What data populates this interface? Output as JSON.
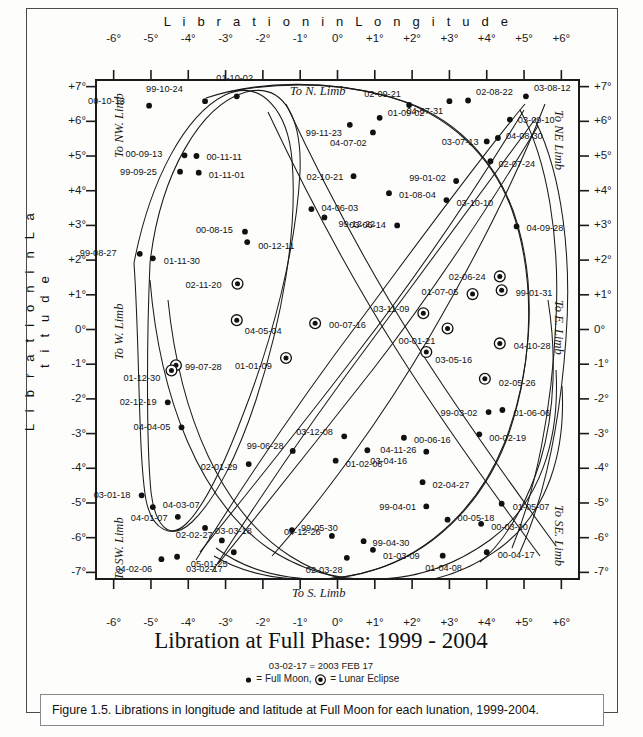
{
  "figure": {
    "title": "Libration at Full Phase:  1999 - 2004",
    "note_date_key": "03-02-17 = 2003 FEB 17",
    "legend_full_moon": "= Full Moon,",
    "legend_eclipse": "= Lunar Eclipse",
    "caption": "Figure 1.5. Librations in longitude and latitude at Full Moon for each lunation, 1999-2004."
  },
  "limbs": {
    "north": "To N. Limb",
    "south": "To S. Limb",
    "east": "To E. Limb",
    "west": "To W. Limb",
    "northwest": "To NW. Limb",
    "northeast": "To NE Limb",
    "southwest": "To SW. Limb",
    "southeast": "To SE. Limb"
  },
  "chart_data": {
    "type": "scatter",
    "title": "Libration at Full Phase:  1999 - 2004",
    "xlabel": "L i b r a t i o n   i n   L o n g i t u d e",
    "ylabel": "L i b r a t i o n   i n   L a t i t u d e",
    "xlim": [
      -6.6,
      6.6
    ],
    "ylim": [
      -7.4,
      7.4
    ],
    "grid": false,
    "xticks": [
      "-6°",
      "-5°",
      "-4°",
      "-3°",
      "-2°",
      "-1°",
      "0°",
      "+1°",
      "+2°",
      "+3°",
      "+4°",
      "+5°",
      "+6°"
    ],
    "xtickvals": [
      -6,
      -5,
      -4,
      -3,
      -2,
      -1,
      0,
      1,
      2,
      3,
      4,
      5,
      6
    ],
    "yticks": [
      "+7°",
      "+6°",
      "+5°",
      "+4°",
      "+3°",
      "+2°",
      "+1°",
      "0°",
      "-1°",
      "-2°",
      "-3°",
      "-4°",
      "-5°",
      "-6°",
      "-7°"
    ],
    "ytickvals": [
      7,
      6,
      5,
      4,
      3,
      2,
      1,
      0,
      -1,
      -2,
      -3,
      -4,
      -5,
      -6,
      -7
    ],
    "legend": [
      "= Full Moon",
      "= Lunar Eclipse"
    ],
    "points": [
      {
        "label": "00-10-13",
        "x": -5.05,
        "y": 6.45,
        "eclipse": false,
        "lx": -24,
        "ly": -4,
        "anchor": "end"
      },
      {
        "label": "99-10-24",
        "x": -3.55,
        "y": 6.58,
        "eclipse": false,
        "lx": -22,
        "ly": -11,
        "anchor": "end"
      },
      {
        "label": "01-10-02",
        "x": -2.7,
        "y": 6.72,
        "eclipse": false,
        "lx": -2,
        "ly": -17,
        "anchor": "middle"
      },
      {
        "label": "01-09-02",
        "x": 1.13,
        "y": 6.1,
        "eclipse": false,
        "lx": 8,
        "ly": -4,
        "anchor": "start"
      },
      {
        "label": "99-11-23",
        "x": 0.33,
        "y": 5.9,
        "eclipse": false,
        "lx": -8,
        "ly": 9,
        "anchor": "end"
      },
      {
        "label": "02-09-21",
        "x": 1.92,
        "y": 6.47,
        "eclipse": false,
        "lx": -8,
        "ly": -10,
        "anchor": "end"
      },
      {
        "label": "04-07-31",
        "x": 3.0,
        "y": 6.58,
        "eclipse": false,
        "lx": -6,
        "ly": 11,
        "anchor": "end"
      },
      {
        "label": "02-08-22",
        "x": 3.5,
        "y": 6.6,
        "eclipse": false,
        "lx": 8,
        "ly": -8,
        "anchor": "start"
      },
      {
        "label": "03-08-12",
        "x": 5.05,
        "y": 6.72,
        "eclipse": false,
        "lx": 8,
        "ly": -7,
        "anchor": "start"
      },
      {
        "label": "03-09-10",
        "x": 4.62,
        "y": 6.05,
        "eclipse": false,
        "lx": 8,
        "ly": 1,
        "anchor": "start"
      },
      {
        "label": "04-08-30",
        "x": 4.3,
        "y": 5.52,
        "eclipse": false,
        "lx": 8,
        "ly": -1,
        "anchor": "start"
      },
      {
        "label": "03-07-13",
        "x": 4.0,
        "y": 5.42,
        "eclipse": false,
        "lx": -8,
        "ly": 2,
        "anchor": "end"
      },
      {
        "label": "02-07-24",
        "x": 4.1,
        "y": 4.85,
        "eclipse": false,
        "lx": 8,
        "ly": 4,
        "anchor": "start"
      },
      {
        "label": "04-07-02",
        "x": 0.95,
        "y": 5.68,
        "eclipse": false,
        "lx": -6,
        "ly": 12,
        "anchor": "end"
      },
      {
        "label": "00-09-13",
        "x": -4.1,
        "y": 5.02,
        "eclipse": false,
        "lx": -22,
        "ly": 0,
        "anchor": "end"
      },
      {
        "label": "00-11-11",
        "x": -3.78,
        "y": 5.0,
        "eclipse": false,
        "lx": 10,
        "ly": 2,
        "anchor": "start"
      },
      {
        "label": "99-09-25",
        "x": -4.22,
        "y": 4.55,
        "eclipse": false,
        "lx": -23,
        "ly": 1,
        "anchor": "end"
      },
      {
        "label": "01-11-01",
        "x": -3.72,
        "y": 4.52,
        "eclipse": false,
        "lx": 10,
        "ly": 3,
        "anchor": "start"
      },
      {
        "label": "02-10-21",
        "x": 0.43,
        "y": 4.42,
        "eclipse": false,
        "lx": -10,
        "ly": 2,
        "anchor": "end"
      },
      {
        "label": "99-01-02",
        "x": 3.18,
        "y": 4.28,
        "eclipse": false,
        "lx": -10,
        "ly": -2,
        "anchor": "end"
      },
      {
        "label": "01-08-04",
        "x": 1.38,
        "y": 3.93,
        "eclipse": false,
        "lx": 10,
        "ly": 3,
        "anchor": "start"
      },
      {
        "label": "03-10-10",
        "x": 2.92,
        "y": 3.73,
        "eclipse": false,
        "lx": 10,
        "ly": 4,
        "anchor": "start"
      },
      {
        "label": "04-06-03",
        "x": -0.7,
        "y": 3.47,
        "eclipse": false,
        "lx": 10,
        "ly": 0,
        "anchor": "start"
      },
      {
        "label": "99-12-22",
        "x": -0.35,
        "y": 3.23,
        "eclipse": false,
        "lx": 14,
        "ly": 8,
        "anchor": "start"
      },
      {
        "label": "00-08-15",
        "x": -2.48,
        "y": 2.82,
        "eclipse": false,
        "lx": -12,
        "ly": -1,
        "anchor": "end"
      },
      {
        "label": "00-12-11",
        "x": -2.42,
        "y": 2.52,
        "eclipse": false,
        "lx": 11,
        "ly": 5,
        "anchor": "start"
      },
      {
        "label": "03-06-14",
        "x": 1.6,
        "y": 3.0,
        "eclipse": false,
        "lx": -11,
        "ly": 1,
        "anchor": "end"
      },
      {
        "label": "04-09-28",
        "x": 4.8,
        "y": 2.97,
        "eclipse": false,
        "lx": 10,
        "ly": 3,
        "anchor": "start"
      },
      {
        "label": "99-08-27",
        "x": -5.3,
        "y": 2.18,
        "eclipse": false,
        "lx": -23,
        "ly": 0,
        "anchor": "end"
      },
      {
        "label": "01-11-30",
        "x": -4.95,
        "y": 2.05,
        "eclipse": false,
        "lx": 11,
        "ly": 4,
        "anchor": "start"
      },
      {
        "label": "02-06-24",
        "x": 4.35,
        "y": 1.53,
        "eclipse": true,
        "lx": -14,
        "ly": 2,
        "anchor": "end"
      },
      {
        "label": "02-11-20",
        "x": -2.68,
        "y": 1.32,
        "eclipse": true,
        "lx": -16,
        "ly": 2,
        "anchor": "end"
      },
      {
        "label": "01-07-05",
        "x": 3.62,
        "y": 1.02,
        "eclipse": true,
        "lx": -14,
        "ly": -1,
        "anchor": "end"
      },
      {
        "label": "99-01-31",
        "x": 4.4,
        "y": 1.13,
        "eclipse": true,
        "lx": 14,
        "ly": 4,
        "anchor": "start"
      },
      {
        "label": "03-11-09",
        "x": 2.3,
        "y": 0.47,
        "eclipse": true,
        "lx": -14,
        "ly": -3,
        "anchor": "end"
      },
      {
        "label": "04-05-04",
        "x": -2.7,
        "y": 0.27,
        "eclipse": true,
        "lx": 8,
        "ly": 12,
        "anchor": "start"
      },
      {
        "label": "00-07-16",
        "x": -0.6,
        "y": 0.18,
        "eclipse": true,
        "lx": 14,
        "ly": 3,
        "anchor": "start"
      },
      {
        "label": "00-01-21",
        "x": 2.95,
        "y": 0.03,
        "eclipse": true,
        "lx": -12,
        "ly": 14,
        "anchor": "end"
      },
      {
        "label": "04-10-28",
        "x": 4.35,
        "y": -0.4,
        "eclipse": true,
        "lx": 14,
        "ly": 4,
        "anchor": "start"
      },
      {
        "label": "03-05-16",
        "x": 2.38,
        "y": -0.65,
        "eclipse": true,
        "lx": 9,
        "ly": 9,
        "anchor": "start"
      },
      {
        "label": "01-01-09",
        "x": -1.38,
        "y": -0.82,
        "eclipse": true,
        "lx": -14,
        "ly": 9,
        "anchor": "end"
      },
      {
        "label": "99-07-28",
        "x": -4.33,
        "y": -1.03,
        "eclipse": true,
        "lx": 9,
        "ly": 3,
        "anchor": "start"
      },
      {
        "label": "01-12-30",
        "x": -4.45,
        "y": -1.18,
        "eclipse": true,
        "lx": -11,
        "ly": 9,
        "anchor": "end"
      },
      {
        "label": "02-05-26",
        "x": 3.95,
        "y": -1.42,
        "eclipse": true,
        "lx": 14,
        "ly": 5,
        "anchor": "start"
      },
      {
        "label": "02-12-19",
        "x": -4.55,
        "y": -2.1,
        "eclipse": false,
        "lx": -11,
        "ly": 1,
        "anchor": "end"
      },
      {
        "label": "99-03-02",
        "x": 4.05,
        "y": -2.38,
        "eclipse": false,
        "lx": -11,
        "ly": 2,
        "anchor": "end"
      },
      {
        "label": "01-06-06",
        "x": 4.42,
        "y": -2.32,
        "eclipse": false,
        "lx": 11,
        "ly": 4,
        "anchor": "start"
      },
      {
        "label": "04-04-05",
        "x": -4.18,
        "y": -2.82,
        "eclipse": false,
        "lx": -11,
        "ly": 1,
        "anchor": "end"
      },
      {
        "label": "00-02-19",
        "x": 3.8,
        "y": -3.02,
        "eclipse": false,
        "lx": 10,
        "ly": 5,
        "anchor": "start"
      },
      {
        "label": "03-12-08",
        "x": 0.18,
        "y": -3.08,
        "eclipse": false,
        "lx": -11,
        "ly": -3,
        "anchor": "end"
      },
      {
        "label": "00-06-16",
        "x": 1.78,
        "y": -3.12,
        "eclipse": false,
        "lx": 10,
        "ly": 3,
        "anchor": "start"
      },
      {
        "label": "99-06-28",
        "x": -1.2,
        "y": -3.5,
        "eclipse": false,
        "lx": -9,
        "ly": -4,
        "anchor": "end"
      },
      {
        "label": "03-04-16",
        "x": 0.8,
        "y": -3.48,
        "eclipse": false,
        "lx": 3,
        "ly": 12,
        "anchor": "start"
      },
      {
        "label": "04-11-26",
        "x": 2.38,
        "y": -3.52,
        "eclipse": false,
        "lx": -10,
        "ly": -1,
        "anchor": "end"
      },
      {
        "label": "01-02-08",
        "x": -0.05,
        "y": -3.78,
        "eclipse": false,
        "lx": 10,
        "ly": 4,
        "anchor": "start"
      },
      {
        "label": "02-01-29",
        "x": -2.38,
        "y": -3.88,
        "eclipse": false,
        "lx": -11,
        "ly": 4,
        "anchor": "end"
      },
      {
        "label": "02-04-27",
        "x": 2.28,
        "y": -4.4,
        "eclipse": false,
        "lx": 10,
        "ly": 4,
        "anchor": "start"
      },
      {
        "label": "03-01-18",
        "x": -5.25,
        "y": -4.78,
        "eclipse": false,
        "lx": -11,
        "ly": 1,
        "anchor": "end"
      },
      {
        "label": "02-01-29b",
        "x": -2.38,
        "y": -3.88,
        "eclipse": false,
        "lx": 0,
        "ly": 0,
        "anchor": "middle",
        "hidden": true
      },
      {
        "label": "04-03-07",
        "x": -4.95,
        "y": -5.12,
        "eclipse": false,
        "lx": 10,
        "ly": -1,
        "anchor": "start"
      },
      {
        "label": "99-04-01",
        "x": 2.38,
        "y": -5.1,
        "eclipse": false,
        "lx": -10,
        "ly": 2,
        "anchor": "end"
      },
      {
        "label": "01-05-07",
        "x": 4.4,
        "y": -5.02,
        "eclipse": false,
        "lx": 11,
        "ly": 4,
        "anchor": "start"
      },
      {
        "label": "04-01-07",
        "x": -4.28,
        "y": -5.4,
        "eclipse": false,
        "lx": -10,
        "ly": 2,
        "anchor": "end"
      },
      {
        "label": "00-05-18",
        "x": 2.95,
        "y": -5.48,
        "eclipse": false,
        "lx": 10,
        "ly": -1,
        "anchor": "start"
      },
      {
        "label": "00-03-20",
        "x": 3.85,
        "y": -5.6,
        "eclipse": false,
        "lx": 10,
        "ly": 4,
        "anchor": "start"
      },
      {
        "label": "03-03-18",
        "x": -3.55,
        "y": -5.72,
        "eclipse": false,
        "lx": 10,
        "ly": 4,
        "anchor": "start"
      },
      {
        "label": "99-05-30",
        "x": -1.22,
        "y": -5.78,
        "eclipse": false,
        "lx": 9,
        "ly": -1,
        "anchor": "start"
      },
      {
        "label": "04-12-26",
        "x": -0.15,
        "y": -5.95,
        "eclipse": false,
        "lx": -11,
        "ly": -3,
        "anchor": "end"
      },
      {
        "label": "02-02-27",
        "x": -3.1,
        "y": -6.08,
        "eclipse": false,
        "lx": -9,
        "ly": -4,
        "anchor": "end"
      },
      {
        "label": "99-04-30",
        "x": 0.7,
        "y": -6.1,
        "eclipse": false,
        "lx": 9,
        "ly": 3,
        "anchor": "start"
      },
      {
        "label": "01-03-09",
        "x": 0.95,
        "y": -6.35,
        "eclipse": false,
        "lx": 10,
        "ly": 7,
        "anchor": "start"
      },
      {
        "label": "00-04-17",
        "x": 4.0,
        "y": -6.42,
        "eclipse": false,
        "lx": 11,
        "ly": 4,
        "anchor": "start"
      },
      {
        "label": "04-02-06",
        "x": -4.72,
        "y": -6.62,
        "eclipse": false,
        "lx": -9,
        "ly": 11,
        "anchor": "end"
      },
      {
        "label": "03-02-17",
        "x": -4.3,
        "y": -6.55,
        "eclipse": false,
        "lx": 9,
        "ly": 13,
        "anchor": "start"
      },
      {
        "label": "05-01-25",
        "x": -2.78,
        "y": -6.42,
        "eclipse": false,
        "lx": -6,
        "ly": 13,
        "anchor": "end"
      },
      {
        "label": "02-03-28",
        "x": 0.25,
        "y": -6.58,
        "eclipse": false,
        "lx": -4,
        "ly": 13,
        "anchor": "end"
      },
      {
        "label": "01-04-08",
        "x": 2.82,
        "y": -6.52,
        "eclipse": false,
        "lx": 1,
        "ly": 13,
        "anchor": "middle"
      }
    ],
    "curves": [
      {
        "name": "loop-1999",
        "d": "M 134 263 C 150 180, 185 115, 225 95 C 262 78, 288 112, 292 160 C 298 230, 282 320, 256 400 C 238 455, 215 500, 192 522 C 172 541, 152 530, 146 500 C 138 455, 140 350, 134 263 Z"
      },
      {
        "name": "loop-2000",
        "d": "M 150 263 C 160 175, 200 105, 246 92 C 285 82, 302 120, 300 172 C 296 250, 272 340, 244 412 C 226 460, 206 505, 186 524 C 168 541, 155 524, 151 492 C 146 440, 147 330, 150 263 Z"
      },
      {
        "name": "arc-a",
        "d": "M 206 98 C 260 80, 330 80, 390 97 C 448 114, 492 155, 512 210 C 536 278, 533 360, 510 430 C 488 496, 440 548, 380 568 C 322 587, 258 582, 214 556"
      },
      {
        "name": "arc-b",
        "d": "M 228 92 C 288 80, 352 83, 406 102 C 462 122, 502 168, 518 226 C 538 296, 530 378, 504 444 C 480 504, 432 552, 374 570 C 318 588, 256 578, 216 548"
      },
      {
        "name": "diag-1",
        "d": "M 196 560 C 240 490, 300 400, 362 318 C 420 240, 478 160, 525 104"
      },
      {
        "name": "diag-2",
        "d": "M 212 572 C 258 500, 318 412, 378 332 C 436 254, 492 178, 536 118"
      },
      {
        "name": "diag-3",
        "d": "M 524 110 C 480 182, 420 272, 358 352 C 300 428, 242 500, 200 552"
      },
      {
        "name": "diag-4",
        "d": "M 538 126 C 494 198, 436 288, 374 368 C 316 442, 260 512, 218 564"
      },
      {
        "name": "cross-1",
        "d": "M 268 112 C 300 180, 346 270, 398 352 C 446 428, 500 502, 540 556"
      },
      {
        "name": "cross-2",
        "d": "M 286 104 C 318 172, 364 262, 416 344 C 464 420, 518 494, 556 546"
      },
      {
        "name": "cross-3",
        "d": "M 545 104 C 520 168, 480 250, 430 336 C 382 418, 322 500, 272 556"
      },
      {
        "name": "bowl-1",
        "d": "M 150 280 C 160 400, 200 500, 268 548 C 336 594, 424 588, 490 540 C 540 503, 560 440, 556 370"
      },
      {
        "name": "bowl-2",
        "d": "M 168 300 C 180 418, 222 512, 290 556 C 356 598, 440 592, 500 548 C 548 512, 566 452, 562 386"
      },
      {
        "name": "swirl-1",
        "d": "M 520 110 C 548 160, 560 240, 556 320 C 552 410, 536 490, 512 548"
      },
      {
        "name": "swirl-2",
        "d": "M 536 122 C 562 176, 572 256, 566 338 C 560 424, 544 498, 520 552"
      },
      {
        "name": "inner-loop",
        "d": "M 548 300 C 556 350, 556 410, 540 462 C 524 512, 500 546, 480 562"
      }
    ]
  }
}
